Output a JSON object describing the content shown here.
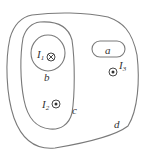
{
  "diagram": {
    "type": "ampere-loops",
    "stroke_color": "#7a7a7a",
    "text_color": "#333333",
    "loops": [
      {
        "id": "a",
        "label": "a"
      },
      {
        "id": "b",
        "label": "b"
      },
      {
        "id": "c",
        "label": "c"
      },
      {
        "id": "d",
        "label": "d"
      }
    ],
    "currents": [
      {
        "id": "I1",
        "label": "I",
        "subscript": "1",
        "direction": "into-page",
        "symbol": "⊗"
      },
      {
        "id": "I2",
        "label": "I",
        "subscript": "2",
        "direction": "out-of-page",
        "symbol": "⊙"
      },
      {
        "id": "I3",
        "label": "I",
        "subscript": "3",
        "direction": "out-of-page",
        "symbol": "⊙"
      }
    ]
  }
}
